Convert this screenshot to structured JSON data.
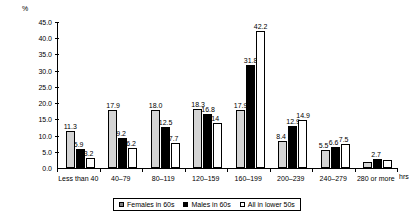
{
  "chart_data": {
    "type": "bar",
    "title": "",
    "xlabel": "hrs",
    "ylabel": "%",
    "ylim": [
      0,
      45
    ],
    "ytick_step": 5,
    "yticks": [
      "0.0",
      "5.0",
      "10.0",
      "15.0",
      "20.0",
      "25.0",
      "30.0",
      "35.0",
      "40.0",
      "45.0"
    ],
    "grid": false,
    "legend_position": "bottom",
    "categories": [
      "Less than 40",
      "40–79",
      "80–119",
      "120–159",
      "160–199",
      "200–239",
      "240–279",
      "280 or more"
    ],
    "series": [
      {
        "name": "Females in 60s",
        "color": "#d4d4d4",
        "values": [
          11.3,
          17.9,
          18.0,
          18.3,
          17.9,
          8.4,
          5.5,
          2.0
        ],
        "labels": [
          "11.3",
          "17.9",
          "18.0",
          "18.3",
          "17.9",
          "8.4",
          "5.5",
          ""
        ]
      },
      {
        "name": "Males in  60s",
        "color": "#000000",
        "values": [
          5.9,
          9.2,
          12.5,
          16.8,
          31.8,
          12.9,
          6.6,
          2.7
        ],
        "labels": [
          "5.9",
          "9.2",
          "12.5",
          "16.8",
          "31.8",
          "12.9",
          "6.6",
          "2.7"
        ]
      },
      {
        "name": "All in lower 50s",
        "color": "#ffffff",
        "values": [
          3.2,
          6.2,
          7.7,
          14.0,
          42.2,
          14.9,
          7.5,
          2.5
        ],
        "labels": [
          "3.2",
          "6.2",
          "7.7",
          "14",
          "42.2",
          "14.9",
          "7.5",
          ""
        ]
      }
    ]
  }
}
